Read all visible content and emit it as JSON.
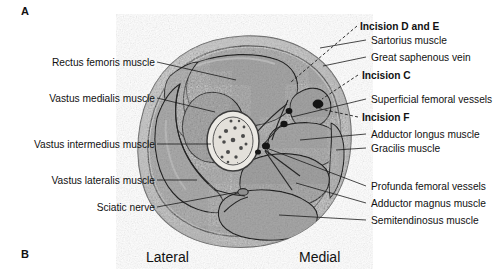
{
  "figure": {
    "panels": [
      {
        "id": "A",
        "letter": "A"
      },
      {
        "id": "B",
        "letter": "B"
      }
    ],
    "orientation": {
      "lateral": "Lateral",
      "medial": "Medial"
    },
    "labels_left": [
      {
        "text": "Rectus femoris muscle",
        "bold": false
      },
      {
        "text": "Vastus medialis muscle",
        "bold": false
      },
      {
        "text": "Vastus intermedius muscle",
        "bold": false
      },
      {
        "text": "Vastus lateralis muscle",
        "bold": false
      },
      {
        "text": "Sciatic nerve",
        "bold": false
      }
    ],
    "labels_right": [
      {
        "text": "Incision D and E",
        "bold": true
      },
      {
        "text": "Sartorius muscle",
        "bold": false
      },
      {
        "text": "Great saphenous vein",
        "bold": false
      },
      {
        "text": "Incision C",
        "bold": true
      },
      {
        "text": "Superficial femoral vessels",
        "bold": false
      },
      {
        "text": "Incision F",
        "bold": true
      },
      {
        "text": "Adductor longus muscle",
        "bold": false
      },
      {
        "text": "Gracilis muscle",
        "bold": false
      },
      {
        "text": "Profunda femoral vessels",
        "bold": false
      },
      {
        "text": "Adductor magnus muscle",
        "bold": false
      },
      {
        "text": "Semitendinosus muscle",
        "bold": false
      }
    ],
    "colors": {
      "muscle": "#a9a9a9",
      "subcutaneous": "#c9c9c9",
      "bone_cortex": "#ebe9e4",
      "marrow": "#e6e3dd",
      "vessel": "#171717",
      "outline": "#2a2a2a",
      "text": "#111111",
      "background": "#ffffff"
    },
    "caption_alt": "Cross-section of the thigh showing muscle compartments, femur, neurovascular structures and surgical incision sites"
  }
}
